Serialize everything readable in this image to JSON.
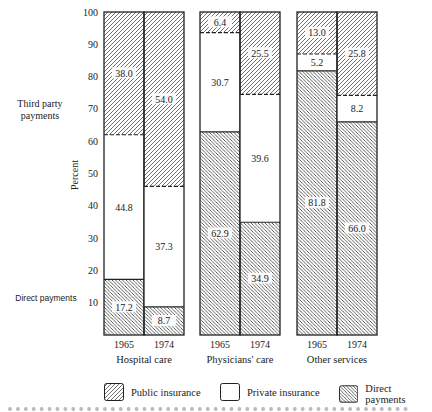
{
  "chart_data": {
    "type": "bar",
    "subtype": "stacked-100-percent",
    "title": "",
    "xlabel": "",
    "ylabel": "Percent",
    "ylim": [
      0,
      100
    ],
    "yticks": [
      10,
      20,
      30,
      40,
      50,
      60,
      70,
      80,
      90,
      100
    ],
    "grid": false,
    "legend_position": "bottom",
    "groups": [
      {
        "label": "Hospital care",
        "bars": [
          {
            "year": "1965",
            "direct": 17.2,
            "private": 44.8,
            "public": 38.0
          },
          {
            "year": "1974",
            "direct": 8.7,
            "private": 37.3,
            "public": 54.0
          }
        ]
      },
      {
        "label": "Physicians' care",
        "bars": [
          {
            "year": "1965",
            "direct": 62.9,
            "private": 30.7,
            "public": 6.4
          },
          {
            "year": "1974",
            "direct": 34.9,
            "private": 39.6,
            "public": 25.5
          }
        ]
      },
      {
        "label": "Other services",
        "bars": [
          {
            "year": "1965",
            "direct": 81.8,
            "private": 5.2,
            "public": 13.0
          },
          {
            "year": "1974",
            "direct": 66.0,
            "private": 8.2,
            "public": 25.8
          }
        ]
      }
    ],
    "series": [
      {
        "name": "Public insurance",
        "key": "public",
        "pattern": "hatch-forward"
      },
      {
        "name": "Private insurance",
        "key": "private",
        "pattern": "blank"
      },
      {
        "name": "Direct payments",
        "key": "direct",
        "pattern": "hatch-backward"
      }
    ],
    "annotations": [
      {
        "text": "Third party payments",
        "near_y": 72
      },
      {
        "text": "Direct payments",
        "near_y": 10
      }
    ]
  },
  "labels": {
    "y_axis": "Percent",
    "third_party_line1": "Third party",
    "third_party_line2": "payments",
    "direct_payments": "Direct payments"
  },
  "legend": {
    "public": "Public insurance",
    "private": "Private insurance",
    "direct": "Direct payments"
  },
  "colors": {
    "ink": "#222222",
    "background": "#ffffff"
  }
}
